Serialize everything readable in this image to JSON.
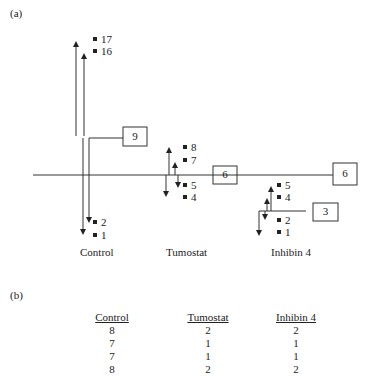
{
  "panel_a": {
    "label": "(a)",
    "groups": [
      {
        "name": "Control",
        "points": [
          "17",
          "16",
          "2",
          "1"
        ],
        "split_box": "9"
      },
      {
        "name": "Tumostat",
        "points": [
          "8",
          "7",
          "5",
          "4"
        ],
        "split_box": "6"
      },
      {
        "name": "Inhibin 4",
        "points": [
          "5",
          "4",
          "2",
          "1"
        ],
        "split_box": "3"
      }
    ],
    "root_box": "6"
  },
  "panel_b": {
    "label": "(b)",
    "columns": [
      "Control",
      "Tumostat",
      "Inhibin 4"
    ],
    "rows": [
      [
        "8",
        "2",
        "2"
      ],
      [
        "7",
        "1",
        "1"
      ],
      [
        "7",
        "1",
        "1"
      ],
      [
        "8",
        "2",
        "2"
      ]
    ]
  }
}
